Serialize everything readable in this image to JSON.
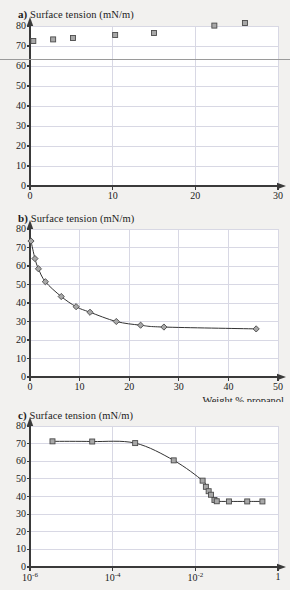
{
  "figure": {
    "background_color": "#f2f1ef",
    "plot_background_color": "#ffffff",
    "axis_color": "#3a3a3a",
    "grid_color": "#d8d8e4",
    "curve_color": "#333333",
    "marker_fill": "#a8a8a8",
    "marker_edge": "#4a4a4a"
  },
  "panels": [
    {
      "key": "a",
      "label": "a)",
      "title": "Surface tension (mN/m)",
      "xlabel": "Weight % NaCl",
      "ylabel": "Surface tension (mN/m)"
    },
    {
      "key": "b",
      "label": "b)",
      "title": "Surface tension (mN/m)",
      "xlabel": "Weight % propanol",
      "ylabel": "Surface tension (mN/m)"
    },
    {
      "key": "c",
      "label": "c)",
      "title": "Surface tension (mN/m)",
      "xlabel": "",
      "ylabel": "Surface tension (mN/m)"
    }
  ],
  "chart_data": [
    {
      "type": "scatter",
      "panel": "a",
      "title": "Surface tension (mN/m)",
      "xlabel": "Weight % NaCl",
      "ylabel": "Surface tension (mN/m)",
      "xscale": "linear",
      "yscale": "linear",
      "xlim": [
        0,
        30
      ],
      "ylim": [
        0,
        80
      ],
      "xticks": [
        0,
        10,
        20,
        30
      ],
      "yticks": [
        0,
        10,
        20,
        30,
        40,
        50,
        60,
        70,
        80
      ],
      "xticklabels": [
        "0",
        "10",
        "20",
        "30"
      ],
      "yticklabels": [
        "0",
        "10",
        "20",
        "30",
        "40",
        "50",
        "60",
        "70",
        "80"
      ],
      "grid": true,
      "legend": null,
      "marker": "square",
      "has_line": false,
      "points": [
        {
          "x": 0.4,
          "y": 72.5
        },
        {
          "x": 2.8,
          "y": 73.3
        },
        {
          "x": 5.2,
          "y": 74.0
        },
        {
          "x": 10.3,
          "y": 75.5
        },
        {
          "x": 15.0,
          "y": 76.5
        },
        {
          "x": 22.3,
          "y": 80.2
        },
        {
          "x": 26.0,
          "y": 81.5
        }
      ],
      "annotations": [
        {
          "type": "horizontal-rule",
          "y": 63.5,
          "color": "#9a9a9a",
          "full_width": true
        }
      ]
    },
    {
      "type": "scatter",
      "panel": "b",
      "title": "Surface tension (mN/m)",
      "xlabel": "Weight % propanol",
      "ylabel": "Surface tension (mN/m)",
      "xscale": "linear",
      "yscale": "linear",
      "xlim": [
        0,
        50
      ],
      "ylim": [
        0,
        80
      ],
      "xticks": [
        0,
        10,
        20,
        30,
        40,
        50
      ],
      "yticks": [
        0,
        10,
        20,
        30,
        40,
        50,
        60,
        70,
        80
      ],
      "xticklabels": [
        "0",
        "10",
        "20",
        "30",
        "40",
        "50"
      ],
      "yticklabels": [
        "0",
        "10",
        "20",
        "30",
        "40",
        "50",
        "60",
        "70",
        "80"
      ],
      "grid": true,
      "legend": null,
      "marker": "diamond",
      "has_line": true,
      "points": [
        {
          "x": 0.2,
          "y": 73.5
        },
        {
          "x": 1.0,
          "y": 64.0
        },
        {
          "x": 1.7,
          "y": 58.5
        },
        {
          "x": 3.1,
          "y": 51.5
        },
        {
          "x": 6.3,
          "y": 43.5
        },
        {
          "x": 9.3,
          "y": 38.0
        },
        {
          "x": 12.1,
          "y": 35.0
        },
        {
          "x": 17.4,
          "y": 30.0
        },
        {
          "x": 22.3,
          "y": 28.0
        },
        {
          "x": 27.0,
          "y": 27.0
        },
        {
          "x": 45.6,
          "y": 26.0
        }
      ]
    },
    {
      "type": "scatter",
      "panel": "c",
      "title": "Surface tension (mN/m)",
      "xlabel": "",
      "ylabel": "Surface tension (mN/m)",
      "xscale": "log",
      "yscale": "linear",
      "xlim": [
        1e-06,
        1
      ],
      "ylim": [
        0,
        80
      ],
      "xticks": [
        1e-06,
        0.0001,
        0.01,
        1
      ],
      "yticks": [
        0,
        10,
        20,
        30,
        40,
        50,
        60,
        70,
        80
      ],
      "xticklabels": [
        "10-6",
        "10-4",
        "10-2",
        "1"
      ],
      "yticklabels": [
        "0",
        "10",
        "20",
        "30",
        "40",
        "50",
        "60",
        "70",
        "80"
      ],
      "grid": true,
      "legend": null,
      "marker": "square",
      "has_line": true,
      "points": [
        {
          "x": 3.5e-06,
          "y": 71.3
        },
        {
          "x": 3.2e-05,
          "y": 71.2
        },
        {
          "x": 0.00035,
          "y": 70.3
        },
        {
          "x": 0.003,
          "y": 60.5
        },
        {
          "x": 0.015,
          "y": 49.0
        },
        {
          "x": 0.018,
          "y": 45.5
        },
        {
          "x": 0.021,
          "y": 43.0
        },
        {
          "x": 0.024,
          "y": 41.0
        },
        {
          "x": 0.029,
          "y": 38.0
        },
        {
          "x": 0.033,
          "y": 37.3
        },
        {
          "x": 0.065,
          "y": 37.2
        },
        {
          "x": 0.18,
          "y": 37.2
        },
        {
          "x": 0.42,
          "y": 37.2
        }
      ]
    }
  ]
}
